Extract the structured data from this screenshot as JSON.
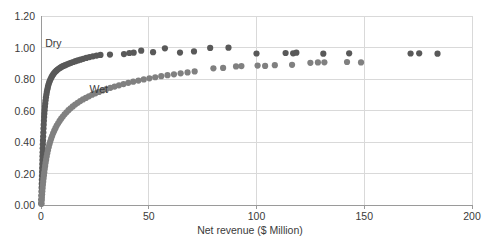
{
  "chart_data": {
    "type": "scatter",
    "title": "",
    "xlabel": "Net revenue ($ Million)",
    "ylabel": "",
    "xlim": [
      0,
      200
    ],
    "ylim": [
      0,
      1.2
    ],
    "xticks": [
      0,
      50,
      100,
      150,
      200
    ],
    "xtick_labels": [
      "0",
      "50",
      "100",
      "150",
      "200"
    ],
    "yticks": [
      0.0,
      0.2,
      0.4,
      0.6,
      0.8,
      1.0,
      1.2
    ],
    "ytick_labels": [
      "0.00",
      "0.20",
      "0.40",
      "0.60",
      "0.80",
      "1.00",
      "1.20"
    ],
    "grid": true,
    "grid_color": "#d9d9d9",
    "axis_color": "#9a9a9a",
    "legend": "none",
    "annotations": [
      {
        "text": "Dry",
        "x": 1.5,
        "y": 1.02,
        "series": "Dry"
      },
      {
        "text": "Wet",
        "x": 22.0,
        "y": 0.73,
        "series": "Wet"
      }
    ],
    "series": [
      {
        "name": "Dry",
        "color": "#595959",
        "marker": "circle",
        "marker_size": 3.1,
        "points": [
          [
            0.1,
            0.01
          ],
          [
            0.15,
            0.035
          ],
          [
            0.2,
            0.06
          ],
          [
            0.25,
            0.085
          ],
          [
            0.3,
            0.11
          ],
          [
            0.35,
            0.135
          ],
          [
            0.4,
            0.16
          ],
          [
            0.45,
            0.185
          ],
          [
            0.5,
            0.21
          ],
          [
            0.55,
            0.235
          ],
          [
            0.6,
            0.26
          ],
          [
            0.65,
            0.285
          ],
          [
            0.7,
            0.31
          ],
          [
            0.75,
            0.335
          ],
          [
            0.8,
            0.36
          ],
          [
            0.85,
            0.385
          ],
          [
            0.92,
            0.41
          ],
          [
            1.0,
            0.435
          ],
          [
            1.08,
            0.46
          ],
          [
            1.16,
            0.485
          ],
          [
            1.25,
            0.51
          ],
          [
            1.35,
            0.535
          ],
          [
            1.45,
            0.558
          ],
          [
            1.55,
            0.58
          ],
          [
            1.68,
            0.602
          ],
          [
            1.82,
            0.624
          ],
          [
            1.96,
            0.645
          ],
          [
            2.12,
            0.665
          ],
          [
            2.3,
            0.684
          ],
          [
            2.5,
            0.702
          ],
          [
            2.72,
            0.719
          ],
          [
            2.95,
            0.735
          ],
          [
            3.2,
            0.75
          ],
          [
            3.48,
            0.764
          ],
          [
            3.78,
            0.777
          ],
          [
            4.1,
            0.789
          ],
          [
            4.45,
            0.8
          ],
          [
            4.82,
            0.81
          ],
          [
            5.22,
            0.82
          ],
          [
            5.65,
            0.829
          ],
          [
            6.1,
            0.838
          ],
          [
            6.6,
            0.846
          ],
          [
            7.15,
            0.853
          ],
          [
            7.72,
            0.86
          ],
          [
            8.35,
            0.866
          ],
          [
            9.0,
            0.872
          ],
          [
            9.7,
            0.878
          ],
          [
            10.45,
            0.883
          ],
          [
            11.25,
            0.888
          ],
          [
            12.1,
            0.893
          ],
          [
            13.0,
            0.898
          ],
          [
            13.95,
            0.903
          ],
          [
            14.95,
            0.908
          ],
          [
            16.0,
            0.913
          ],
          [
            17.1,
            0.918
          ],
          [
            18.3,
            0.923
          ],
          [
            19.6,
            0.928
          ],
          [
            21.0,
            0.934
          ],
          [
            22.5,
            0.939
          ],
          [
            24.1,
            0.944
          ],
          [
            25.8,
            0.949
          ],
          [
            27.6,
            0.953
          ],
          [
            32.0,
            0.955
          ],
          [
            38.5,
            0.958
          ],
          [
            41.0,
            0.965
          ],
          [
            43.0,
            0.967
          ],
          [
            46.5,
            0.98
          ],
          [
            52.0,
            0.97
          ],
          [
            57.5,
            0.995
          ],
          [
            64.5,
            0.968
          ],
          [
            71.0,
            0.975
          ],
          [
            78.5,
            0.997
          ],
          [
            87.0,
            0.999
          ],
          [
            100.0,
            0.962
          ],
          [
            113.5,
            0.965
          ],
          [
            117.0,
            0.963
          ],
          [
            118.5,
            0.967
          ],
          [
            131.0,
            0.961
          ],
          [
            143.0,
            0.963
          ],
          [
            171.5,
            0.962
          ],
          [
            175.5,
            0.963
          ],
          [
            184.0,
            0.961
          ]
        ]
      },
      {
        "name": "Wet",
        "color": "#808080",
        "marker": "circle",
        "marker_size": 3.1,
        "points": [
          [
            0.2,
            0.008
          ],
          [
            0.3,
            0.028
          ],
          [
            0.4,
            0.048
          ],
          [
            0.5,
            0.068
          ],
          [
            0.62,
            0.088
          ],
          [
            0.75,
            0.108
          ],
          [
            0.88,
            0.128
          ],
          [
            1.02,
            0.148
          ],
          [
            1.18,
            0.168
          ],
          [
            1.35,
            0.188
          ],
          [
            1.52,
            0.208
          ],
          [
            1.72,
            0.228
          ],
          [
            1.92,
            0.248
          ],
          [
            2.14,
            0.268
          ],
          [
            2.38,
            0.288
          ],
          [
            2.64,
            0.308
          ],
          [
            2.92,
            0.328
          ],
          [
            3.22,
            0.347
          ],
          [
            3.55,
            0.366
          ],
          [
            3.9,
            0.385
          ],
          [
            4.28,
            0.403
          ],
          [
            4.7,
            0.421
          ],
          [
            5.15,
            0.438
          ],
          [
            5.62,
            0.455
          ],
          [
            6.15,
            0.472
          ],
          [
            6.7,
            0.488
          ],
          [
            7.3,
            0.504
          ],
          [
            7.95,
            0.519
          ],
          [
            8.62,
            0.534
          ],
          [
            9.35,
            0.548
          ],
          [
            10.12,
            0.562
          ],
          [
            10.95,
            0.576
          ],
          [
            11.82,
            0.589
          ],
          [
            12.75,
            0.602
          ],
          [
            13.72,
            0.614
          ],
          [
            14.75,
            0.626
          ],
          [
            15.85,
            0.638
          ],
          [
            17.0,
            0.649
          ],
          [
            18.2,
            0.66
          ],
          [
            19.48,
            0.67
          ],
          [
            20.82,
            0.68
          ],
          [
            22.22,
            0.69
          ],
          [
            23.7,
            0.7
          ],
          [
            25.25,
            0.709
          ],
          [
            26.88,
            0.718
          ],
          [
            28.58,
            0.727
          ],
          [
            30.35,
            0.736
          ],
          [
            32.2,
            0.744
          ],
          [
            34.15,
            0.752
          ],
          [
            36.18,
            0.76
          ],
          [
            38.3,
            0.768
          ],
          [
            40.5,
            0.776
          ],
          [
            42.8,
            0.783
          ],
          [
            45.2,
            0.79
          ],
          [
            47.7,
            0.797
          ],
          [
            50.3,
            0.804
          ],
          [
            53.0,
            0.811
          ],
          [
            55.8,
            0.818
          ],
          [
            58.7,
            0.824
          ],
          [
            61.7,
            0.83
          ],
          [
            64.8,
            0.836
          ],
          [
            68.0,
            0.842
          ],
          [
            71.3,
            0.848
          ],
          [
            80.0,
            0.868
          ],
          [
            84.5,
            0.87
          ],
          [
            90.5,
            0.88
          ],
          [
            93.0,
            0.882
          ],
          [
            100.5,
            0.885
          ],
          [
            104.0,
            0.883
          ],
          [
            108.5,
            0.888
          ],
          [
            116.5,
            0.89
          ],
          [
            125.0,
            0.903
          ],
          [
            128.5,
            0.905
          ],
          [
            131.5,
            0.906
          ],
          [
            142.0,
            0.908
          ],
          [
            148.5,
            0.905
          ]
        ]
      }
    ]
  }
}
